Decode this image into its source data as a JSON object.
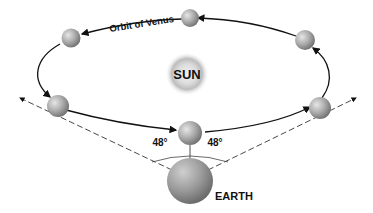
{
  "diagram": {
    "orbit_label": "Orbit of Venus",
    "sun_label": "SUN",
    "earth_label": "EARTH",
    "angle_left": "48°",
    "angle_right": "48°"
  },
  "colors": {
    "planet": "#9a9a9a",
    "line": "#111111",
    "sun_glow": "#bdbdbd"
  }
}
